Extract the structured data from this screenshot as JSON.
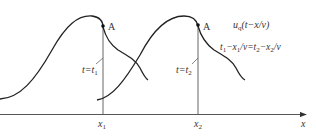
{
  "diagram": {
    "point_label": "A",
    "wave_label_main": "u",
    "wave_label_sub": "q",
    "wave_label_arg": "(t−x/v)",
    "equation": {
      "t1": "t",
      "t1_sub": "1",
      "x1": "−x",
      "x1_sub": "1",
      "mid": "/v=t",
      "t2_sub": "2",
      "x2": "−x",
      "x2_sub": "2",
      "end": "/v"
    },
    "time1": {
      "t": "t=t",
      "sub": "1"
    },
    "time2": {
      "t": "t=t",
      "sub": "2"
    },
    "axis": {
      "x1": "x",
      "x1_sub": "1",
      "x2": "x",
      "x2_sub": "2",
      "x_label": "x"
    }
  }
}
